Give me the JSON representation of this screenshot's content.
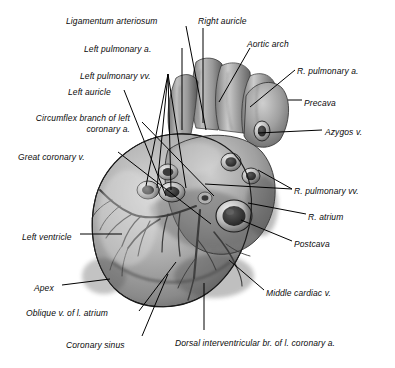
{
  "figure": {
    "view": "dorsal",
    "style": "grayscale airbrush anatomical drawing with leader lines",
    "width": 395,
    "height": 368,
    "background_color": "#ffffff",
    "label_color": "#0a0a0a",
    "leader_color": "#000000"
  },
  "labels": [
    {
      "id": "ligamentum-arteriosum",
      "text": "Ligamentum arteriosum",
      "align": "right",
      "x": 66,
      "y": 16
    },
    {
      "id": "right-auricle",
      "text": "Right auricle",
      "align": "left",
      "x": 198,
      "y": 16
    },
    {
      "id": "left-pulmonary-a",
      "text": "Left pulmonary a.",
      "align": "right",
      "x": 84,
      "y": 44
    },
    {
      "id": "aortic-arch",
      "text": "Aortic arch",
      "align": "left",
      "x": 247,
      "y": 39
    },
    {
      "id": "left-pulmonary-vv",
      "text": "Left pulmonary vv.",
      "align": "right",
      "x": 80,
      "y": 71
    },
    {
      "id": "r-pulmonary-a",
      "text": "R. pulmonary a.",
      "align": "left",
      "x": 297,
      "y": 66
    },
    {
      "id": "left-auricle",
      "text": "Left auricle",
      "align": "right",
      "x": 68,
      "y": 87
    },
    {
      "id": "circumflex-branch-of-left-coronary-a",
      "text": "Circumflex branch of left coronary a.",
      "align": "right",
      "x": 22,
      "y": 113,
      "multiline": true
    },
    {
      "id": "precava",
      "text": "Precava",
      "align": "left",
      "x": 304,
      "y": 98
    },
    {
      "id": "azygos-v",
      "text": "Azygos v.",
      "align": "left",
      "x": 325,
      "y": 127
    },
    {
      "id": "great-coronary-v",
      "text": "Great coronary v.",
      "align": "right",
      "x": 18,
      "y": 152
    },
    {
      "id": "r-pulmonary-vv",
      "text": "R. pulmonary vv.",
      "align": "left",
      "x": 294,
      "y": 186
    },
    {
      "id": "r-atrium",
      "text": "R. atrium",
      "align": "left",
      "x": 308,
      "y": 212
    },
    {
      "id": "left-ventricle",
      "text": "Left ventricle",
      "align": "right",
      "x": 22,
      "y": 232
    },
    {
      "id": "postcava",
      "text": "Postcava",
      "align": "left",
      "x": 294,
      "y": 239
    },
    {
      "id": "apex",
      "text": "Apex",
      "align": "right",
      "x": 34,
      "y": 283
    },
    {
      "id": "middle-cardiac-v",
      "text": "Middle cardiac v.",
      "align": "left",
      "x": 266,
      "y": 288
    },
    {
      "id": "oblique-v-of-l-atrium",
      "text": "Oblique v. of l. atrium",
      "align": "right",
      "x": 26,
      "y": 308
    },
    {
      "id": "coronary-sinus",
      "text": "Coronary sinus",
      "align": "right",
      "x": 66,
      "y": 340
    },
    {
      "id": "dorsal-interventricular-br-of-l-coronary-a",
      "text": "Dorsal interventricular br. of l. coronary a.",
      "align": "left",
      "x": 175,
      "y": 338
    }
  ],
  "leaders": [
    {
      "id": "leader-ligamentum-arteriosum",
      "points": "186,26 206,130"
    },
    {
      "id": "leader-right-auricle",
      "points": "203,28 203,123"
    },
    {
      "id": "leader-aortic-arch",
      "points": "250,48 219,102"
    },
    {
      "id": "leader-left-pulmonary-a",
      "points": "182,48 182,130"
    },
    {
      "id": "leader-left-pulmonary-vv-1",
      "points": "168,74 146,186"
    },
    {
      "id": "leader-left-pulmonary-vv-2",
      "points": "168,74 157,188"
    },
    {
      "id": "leader-left-pulmonary-vv-3",
      "points": "168,74 171,190"
    },
    {
      "id": "leader-left-pulmonary-vv-4",
      "points": "168,74 186,188"
    },
    {
      "id": "leader-left-auricle",
      "points": "124,90 166,196"
    },
    {
      "id": "leader-r-pulmonary-a",
      "points": "295,70 250,107"
    },
    {
      "id": "leader-precava",
      "points": "288,100 302,100"
    },
    {
      "id": "leader-circumflex",
      "points": "142,122 214,196"
    },
    {
      "id": "leader-azygos-v",
      "points": "258,133 322,130"
    },
    {
      "id": "leader-great-coronary-v",
      "points": "118,152 211,224"
    },
    {
      "id": "leader-r-pulmonary-vv-1",
      "points": "292,189 205,184"
    },
    {
      "id": "leader-r-pulmonary-vv-2",
      "points": "292,189 258,170"
    },
    {
      "id": "leader-r-atrium",
      "points": "306,214 248,203"
    },
    {
      "id": "leader-left-ventricle",
      "points": "80,234 122,234"
    },
    {
      "id": "leader-postcava",
      "points": "292,241 241,220"
    },
    {
      "id": "leader-apex",
      "points": "62,285 110,279"
    },
    {
      "id": "leader-middle-cardiac-v",
      "points": "264,290 229,260"
    },
    {
      "id": "leader-oblique-v",
      "points": "139,311 176,262"
    },
    {
      "id": "leader-coronary-sinus",
      "points": "142,336 168,274"
    },
    {
      "id": "leader-dorsal-interventricular",
      "points": "204,330 204,283"
    }
  ],
  "palette": {
    "heart_light": "#c9c9c9",
    "heart_mid": "#9a9a9a",
    "heart_dark": "#4f4f4f",
    "heart_shadow": "#2a2a2a",
    "vessel_rim": "#e8e8e8",
    "vessel_lumen": "#3a3a3a",
    "outline": "#1a1a1a"
  }
}
